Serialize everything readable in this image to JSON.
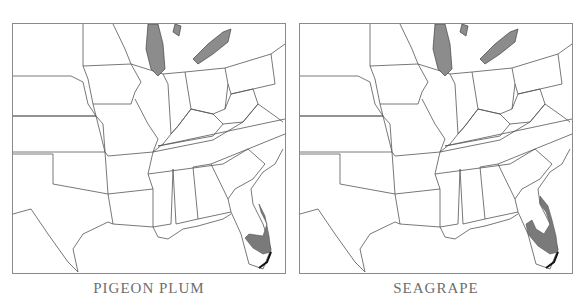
{
  "figure": {
    "panels": [
      {
        "id": "pigeon-plum",
        "caption": "PIGEON PLUM",
        "range_region": "South Florida coast and tip, Florida Keys"
      },
      {
        "id": "seagrape",
        "caption": "SEAGRAPE",
        "range_region": "Central and South Florida coasts, Florida Keys"
      }
    ],
    "map_extent": "Eastern United States",
    "colors": {
      "range_fill": "#7a7a7a",
      "lake_fill": "#8c8c8c",
      "border": "#555555",
      "caption": "#6e6e6e"
    }
  }
}
